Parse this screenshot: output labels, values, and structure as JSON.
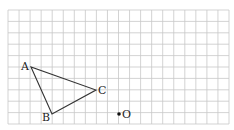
{
  "figure": {
    "type": "grid-geometry",
    "grid": {
      "left": 8,
      "top": 10,
      "cols": 20,
      "rows": 10,
      "cell_w": 11.05,
      "cell_h": 11.4,
      "line_color": "#c8c8c8"
    },
    "shape": {
      "name": "triangle ABC",
      "stroke": "#333333",
      "vertices": [
        {
          "label": "A",
          "x": 31,
          "y": 67
        },
        {
          "label": "B",
          "x": 52,
          "y": 114
        },
        {
          "label": "C",
          "x": 96,
          "y": 90
        }
      ]
    },
    "point_o": {
      "label": "O",
      "x": 119,
      "y": 114
    }
  },
  "labels": {
    "A": "A",
    "B": "B",
    "C": "C",
    "O": "O"
  }
}
